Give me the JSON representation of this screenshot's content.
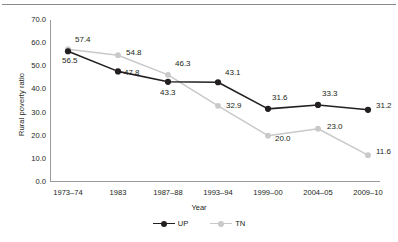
{
  "chart_data": {
    "type": "line",
    "title": "",
    "xlabel": "Year",
    "ylabel": "Rural poverty ratio",
    "categories": [
      "1973–74",
      "1983",
      "1987–88",
      "1993–94",
      "1999–00",
      "2004–05",
      "2009–10"
    ],
    "series": [
      {
        "name": "UP",
        "color": "#231f20",
        "values": [
          56.5,
          47.8,
          43.3,
          43.1,
          31.6,
          33.3,
          31.2
        ],
        "labels": [
          "56.5",
          "47.8",
          "43.3",
          "43.1",
          "31.6",
          "33.3",
          "31.2"
        ]
      },
      {
        "name": "TN",
        "color": "#c9c9c9",
        "values": [
          57.4,
          54.8,
          46.3,
          32.9,
          20.0,
          23.0,
          11.6
        ],
        "labels": [
          "57.4",
          "54.8",
          "46.3",
          "32.9",
          "20.0",
          "23.0",
          "11.6"
        ]
      }
    ],
    "ylim": [
      0,
      70
    ],
    "ytick_values": [
      70.0,
      60.0,
      50.0,
      40.0,
      30.0,
      20.0,
      10.0,
      0.0
    ],
    "ytick_labels": [
      "70.0",
      "60.0",
      "50.0",
      "40.0",
      "30.0",
      "20.0",
      "10.0",
      "0.0"
    ],
    "grid": false,
    "legend_position": "bottom",
    "legend": [
      "UP",
      "TN"
    ]
  },
  "axes": {
    "y_title": "Rural poverty ratio",
    "x_title": "Year"
  },
  "legend": {
    "items": [
      {
        "label": "UP",
        "color": "#231f20"
      },
      {
        "label": "TN",
        "color": "#c9c9c9"
      }
    ]
  }
}
